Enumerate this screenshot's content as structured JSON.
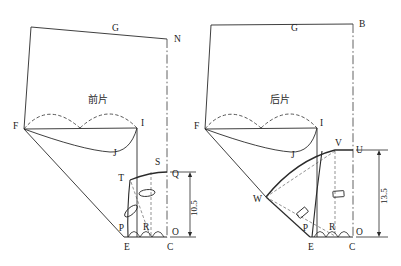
{
  "drawing": {
    "title": "Garment pattern draft — front and back bodice blocks",
    "background_color": "#ffffff",
    "line_color": "#2a2a2a",
    "dashed_color": "#3a3a3a",
    "center_line_color": "#3a3a3a"
  },
  "panels": [
    {
      "id": "front",
      "name_label": "前片",
      "points": [
        {
          "key": "G",
          "label": "G",
          "x": 112,
          "y": 31
        },
        {
          "key": "N",
          "label": "N",
          "x": 174,
          "y": 42
        },
        {
          "key": "F",
          "label": "F",
          "x": 13,
          "y": 129
        },
        {
          "key": "I",
          "label": "I",
          "x": 141,
          "y": 126
        },
        {
          "key": "J",
          "label": "J",
          "x": 113,
          "y": 156
        },
        {
          "key": "S",
          "label": "S",
          "x": 155,
          "y": 165
        },
        {
          "key": "T",
          "label": "T",
          "x": 124,
          "y": 181
        },
        {
          "key": "Q",
          "label": "Q",
          "x": 172,
          "y": 177
        },
        {
          "key": "P",
          "label": "P",
          "x": 124,
          "y": 227
        },
        {
          "key": "R",
          "label": "R",
          "x": 143,
          "y": 228
        },
        {
          "key": "O",
          "label": "O",
          "x": 172,
          "y": 231
        },
        {
          "key": "E",
          "label": "E",
          "x": 127,
          "y": 247
        },
        {
          "key": "C",
          "label": "C",
          "x": 170,
          "y": 247
        }
      ],
      "dimension": {
        "value": "10.5",
        "from": "Q",
        "to": "O"
      },
      "dart_markers": [
        {
          "shape": "ellipse",
          "cx": 147,
          "cy": 193
        },
        {
          "shape": "ellipse",
          "cx": 131,
          "cy": 211
        }
      ]
    },
    {
      "id": "back",
      "name_label": "后片",
      "points": [
        {
          "key": "G",
          "label": "G",
          "x": 291,
          "y": 31
        },
        {
          "key": "B",
          "label": "B",
          "x": 361,
          "y": 27
        },
        {
          "key": "F",
          "label": "F",
          "x": 199,
          "y": 129
        },
        {
          "key": "I",
          "label": "I",
          "x": 320,
          "y": 126
        },
        {
          "key": "J",
          "label": "J",
          "x": 295,
          "y": 156
        },
        {
          "key": "V",
          "label": "V",
          "x": 339,
          "y": 146
        },
        {
          "key": "U",
          "label": "U",
          "x": 355,
          "y": 154
        },
        {
          "key": "W",
          "label": "W",
          "x": 256,
          "y": 200
        },
        {
          "key": "P",
          "label": "P",
          "x": 308,
          "y": 228
        },
        {
          "key": "R",
          "label": "R",
          "x": 331,
          "y": 228
        },
        {
          "key": "O",
          "label": "O",
          "x": 357,
          "y": 231
        },
        {
          "key": "E",
          "label": "E",
          "x": 311,
          "y": 247
        },
        {
          "key": "C",
          "label": "C",
          "x": 352,
          "y": 247
        }
      ],
      "dimension": {
        "value": "13.5",
        "from": "U",
        "to": "O"
      },
      "dart_markers": [
        {
          "shape": "rect",
          "cx": 338,
          "cy": 195
        },
        {
          "shape": "rect",
          "cx": 302,
          "cy": 213
        }
      ]
    }
  ],
  "dimensions": {
    "front_vertical": "10.5",
    "back_vertical": "13.5"
  },
  "labels": {
    "front_piece": "前片",
    "back_piece": "后片"
  }
}
